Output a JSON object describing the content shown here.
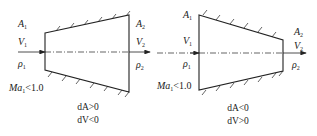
{
  "diagram": {
    "type": "subsonic nozzle/diffuser comparison",
    "axis_color": "#222222",
    "panels": [
      {
        "name": "diverging-duct",
        "inlet": {
          "area": "A",
          "velocity": "V",
          "density": "ρ",
          "sub": "1"
        },
        "outlet": {
          "area": "A",
          "velocity": "V",
          "density": "ρ",
          "sub": "2"
        },
        "mach": {
          "symbol": "Ma",
          "sub": "1",
          "condition": "<1.0"
        },
        "conditions": [
          "dA>0",
          "dV<0"
        ]
      },
      {
        "name": "converging-duct",
        "inlet": {
          "area": "A",
          "velocity": "V",
          "density": "ρ",
          "sub": "1"
        },
        "outlet": {
          "area": "A",
          "velocity": "V",
          "density": "ρ",
          "sub": "2"
        },
        "mach": {
          "symbol": "Ma",
          "sub": "1",
          "condition": "<1.0"
        },
        "conditions": [
          "dA<0",
          "dV>0"
        ]
      }
    ]
  }
}
